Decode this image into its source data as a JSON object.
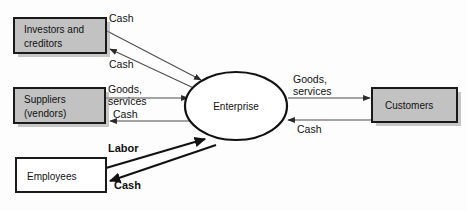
{
  "diagram": {
    "background_color": "#fdfdfd",
    "center": {
      "id": "enterprise",
      "label": "Enterprise",
      "shape": "ellipse",
      "fill": "#ffffff",
      "stroke": "#111111"
    },
    "nodes": [
      {
        "id": "investors",
        "label_line1": "Investors and",
        "label_line2": "creditors",
        "shape": "rectangle",
        "fill": "#c2c2c2",
        "stroke": "#1a1a1a",
        "has_shadow": true
      },
      {
        "id": "suppliers",
        "label_line1": "Suppliers",
        "label_line2": "(vendors)",
        "shape": "rectangle",
        "fill": "#c2c2c2",
        "stroke": "#1a1a1a",
        "has_shadow": true
      },
      {
        "id": "employees",
        "label_line1": "Employees",
        "label_line2": "",
        "shape": "rectangle",
        "fill": "#ffffff",
        "stroke": "#1a1a1a",
        "has_shadow": false
      },
      {
        "id": "customers",
        "label_line1": "Customers",
        "label_line2": "",
        "shape": "rectangle",
        "fill": "#c2c2c2",
        "stroke": "#1a1a1a",
        "has_shadow": true
      }
    ],
    "edges": [
      {
        "id": "investors-to-enterprise",
        "label": "Cash",
        "from": "investors",
        "to": "enterprise",
        "emphasis": "normal"
      },
      {
        "id": "enterprise-to-investors",
        "label": "Cash",
        "from": "enterprise",
        "to": "investors",
        "emphasis": "normal"
      },
      {
        "id": "suppliers-to-enterprise",
        "label_line1": "Goods,",
        "label_line2": "services",
        "from": "suppliers",
        "to": "enterprise",
        "emphasis": "normal"
      },
      {
        "id": "enterprise-to-suppliers",
        "label": "Cash",
        "from": "enterprise",
        "to": "suppliers",
        "emphasis": "normal"
      },
      {
        "id": "employees-to-enterprise",
        "label": "Labor",
        "from": "employees",
        "to": "enterprise",
        "emphasis": "bold"
      },
      {
        "id": "enterprise-to-employees",
        "label": "Cash",
        "from": "enterprise",
        "to": "employees",
        "emphasis": "bold"
      },
      {
        "id": "enterprise-to-customers",
        "label_line1": "Goods,",
        "label_line2": "services",
        "from": "enterprise",
        "to": "customers",
        "emphasis": "normal"
      },
      {
        "id": "customers-to-enterprise",
        "label": "Cash",
        "from": "customers",
        "to": "enterprise",
        "emphasis": "normal"
      }
    ]
  }
}
